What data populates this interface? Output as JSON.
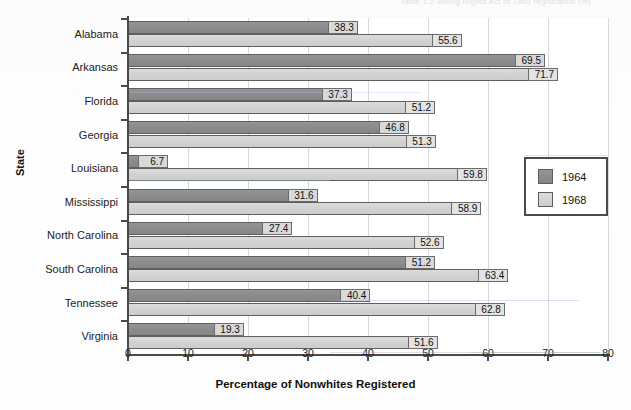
{
  "page": {
    "title_remnant": "Table 1.2  Voting Rights Act of 1965 registration (%)"
  },
  "chart_data": {
    "type": "bar",
    "orientation": "horizontal",
    "title": "",
    "xlabel": "Percentage of Nonwhites Registered",
    "ylabel": "State",
    "xlim": [
      0,
      80
    ],
    "xticks": [
      0,
      10,
      20,
      30,
      40,
      50,
      60,
      70,
      80
    ],
    "grid": "vertical",
    "legend_position": "right-middle",
    "categories": [
      "Alabama",
      "Arkansas",
      "Florida",
      "Georgia",
      "Louisiana",
      "Mississippi",
      "North Carolina",
      "South Carolina",
      "Tennessee",
      "Virginia"
    ],
    "series": [
      {
        "name": "1964",
        "color": "#8c8c8c",
        "values": [
          38.3,
          69.5,
          37.3,
          46.8,
          6.7,
          31.6,
          27.4,
          51.2,
          40.4,
          19.3
        ]
      },
      {
        "name": "1968",
        "color": "#d2d2d2",
        "values": [
          55.6,
          71.7,
          51.2,
          51.3,
          59.8,
          58.9,
          52.6,
          63.4,
          62.8,
          51.6
        ]
      }
    ]
  },
  "legend": {
    "items": [
      {
        "label": "1964",
        "color": "#8c8c8c"
      },
      {
        "label": "1968",
        "color": "#d2d2d2"
      }
    ]
  },
  "axis": {
    "x_tick_labels": [
      "0",
      "10",
      "20",
      "30",
      "40",
      "50",
      "60",
      "70",
      "80"
    ]
  }
}
